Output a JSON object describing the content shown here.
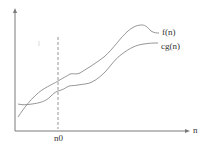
{
  "diagram": {
    "title": "",
    "type": "asymptotic-lower-bound",
    "axes": {
      "x_label": "n",
      "y_label": ""
    },
    "threshold": {
      "label": "n0",
      "style": "dashed"
    },
    "curves": [
      {
        "name": "f(n)",
        "label": "f(n)"
      },
      {
        "name": "cg(n)",
        "label": "cg(n)"
      }
    ],
    "colors": {
      "line": "#8a8a8a",
      "axis": "#7a7a7a",
      "text": "#333333"
    }
  }
}
